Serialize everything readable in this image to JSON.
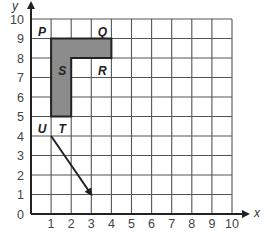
{
  "diagram": {
    "type": "coordinate-grid",
    "x_axis": {
      "label": "x",
      "min": 0,
      "max": 10,
      "ticks": [
        "0",
        "1",
        "2",
        "3",
        "4",
        "5",
        "6",
        "7",
        "8",
        "9",
        "10"
      ]
    },
    "y_axis": {
      "label": "y",
      "min": 0,
      "max": 10,
      "ticks": [
        "0",
        "1",
        "2",
        "3",
        "4",
        "5",
        "6",
        "7",
        "8",
        "9",
        "10"
      ]
    },
    "shaded_figure": {
      "fill": "#8c8c8c",
      "vertices": [
        [
          1,
          9
        ],
        [
          4,
          9
        ],
        [
          4,
          8
        ],
        [
          2,
          8
        ],
        [
          2,
          5
        ],
        [
          1,
          5
        ]
      ]
    },
    "points": [
      {
        "label": "P",
        "x": 1,
        "y": 9,
        "label_pos": [
          0.55,
          9.35
        ]
      },
      {
        "label": "Q",
        "x": 4,
        "y": 9,
        "label_pos": [
          3.55,
          9.35
        ]
      },
      {
        "label": "R",
        "x": 4,
        "y": 8,
        "label_pos": [
          3.55,
          7.35
        ]
      },
      {
        "label": "S",
        "x": 2,
        "y": 8,
        "label_pos": [
          1.55,
          7.35
        ]
      },
      {
        "label": "T",
        "x": 2,
        "y": 5,
        "label_pos": [
          1.55,
          4.35
        ]
      },
      {
        "label": "U",
        "x": 1,
        "y": 5,
        "label_pos": [
          0.55,
          4.35
        ]
      }
    ],
    "translation_arrow": {
      "from": [
        1,
        4
      ],
      "to": [
        3,
        1
      ]
    }
  }
}
